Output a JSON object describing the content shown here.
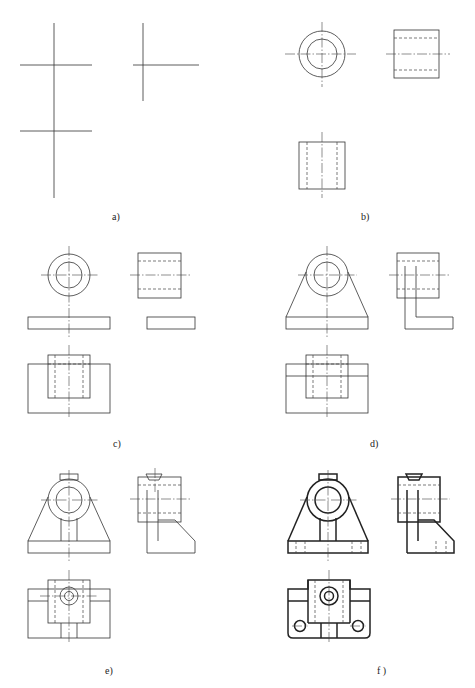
{
  "figure": {
    "panels": [
      {
        "id": "a",
        "label": "a)"
      },
      {
        "id": "b",
        "label": "b)"
      },
      {
        "id": "c",
        "label": "c)"
      },
      {
        "id": "d",
        "label": "d)"
      },
      {
        "id": "e",
        "label": "e)"
      },
      {
        "id": "f",
        "label": "f )"
      }
    ]
  }
}
